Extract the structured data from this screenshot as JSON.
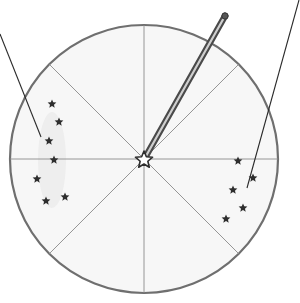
{
  "diagram": {
    "colors": {
      "background": "#ffffff",
      "disc_fill": "#f7f7f7",
      "outline": "#6f6f6f",
      "sector_lines": "#8a8a8a",
      "stars": "#2e2e2e",
      "pointers": "#2a2a2a",
      "rod": "#6a6a6a"
    },
    "circle": {
      "cx": 144,
      "cy": 159,
      "r": 134
    },
    "sectors": 8,
    "center_star": {
      "x": 144,
      "y": 160,
      "size": 9
    },
    "rod": {
      "x1": 146,
      "y1": 156,
      "x2": 225,
      "y2": 16
    },
    "constellations": [
      {
        "name": "left-constellation",
        "stars": [
          [
            52,
            104
          ],
          [
            59,
            122
          ],
          [
            49,
            141
          ],
          [
            54,
            160
          ],
          [
            37,
            179
          ],
          [
            65,
            197
          ],
          [
            46,
            201
          ]
        ]
      },
      {
        "name": "right-constellation",
        "stars": [
          [
            238,
            161
          ],
          [
            253,
            178
          ],
          [
            233,
            190
          ],
          [
            243,
            208
          ],
          [
            226,
            219
          ]
        ]
      }
    ],
    "pointers": [
      {
        "name": "left-pointer",
        "x1": 0,
        "y1": 34,
        "x2": 41,
        "y2": 137
      },
      {
        "name": "right-pointer",
        "x1": 299,
        "y1": 0,
        "x2": 247,
        "y2": 188
      }
    ]
  }
}
